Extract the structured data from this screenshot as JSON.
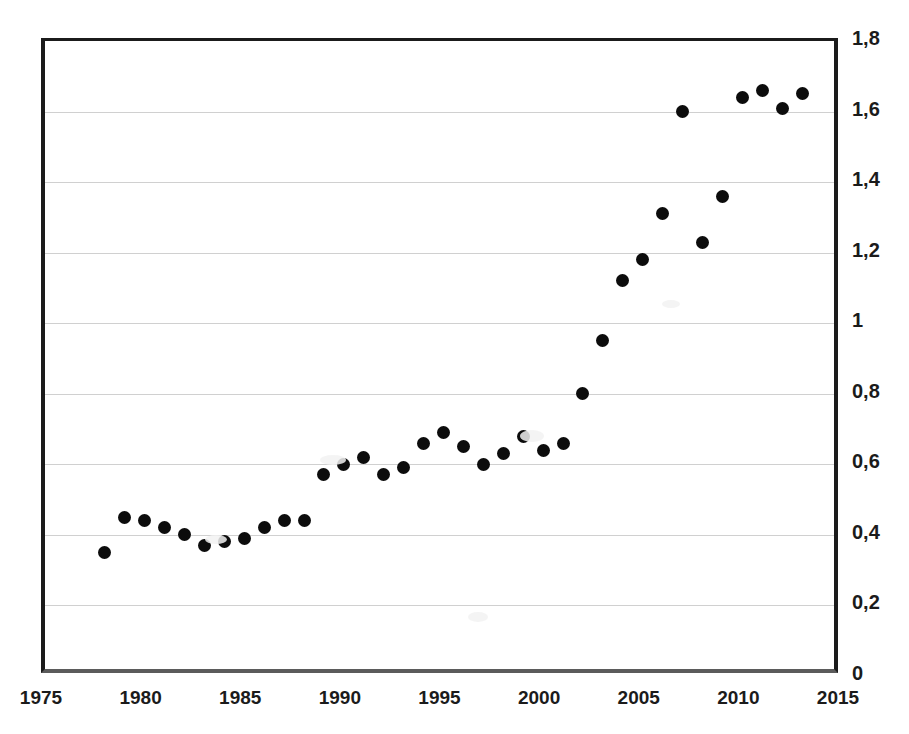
{
  "chart_data": {
    "type": "scatter",
    "title": "",
    "subtitle": "",
    "xlabel": "",
    "ylabel": "",
    "grid": true,
    "legend": null,
    "legend_position": "none",
    "xlim": [
      1975,
      2015
    ],
    "ylim": [
      0,
      1.8
    ],
    "xticks": [
      "1975",
      "1980",
      "1985",
      "1990",
      "1995",
      "2000",
      "2005",
      "2010",
      "2015"
    ],
    "xtick_values": [
      1975,
      1980,
      1985,
      1990,
      1995,
      2000,
      2005,
      2010,
      2015
    ],
    "yticks": [
      "0",
      "0,2",
      "0,4",
      "0,6",
      "0,8",
      "1",
      "1,2",
      "1,4",
      "1,6",
      "1,8"
    ],
    "ytick_values": [
      0,
      0.2,
      0.4,
      0.6,
      0.8,
      1,
      1.2,
      1.4,
      1.6,
      1.8
    ],
    "y_axis_side": "right",
    "decimal_separator": ",",
    "marker": "filled-circle",
    "marker_color": "#0c0c0c",
    "x": [
      1978,
      1979,
      1980,
      1981,
      1982,
      1983,
      1984,
      1985,
      1986,
      1987,
      1988,
      1989,
      1990,
      1991,
      1992,
      1993,
      1994,
      1995,
      1996,
      1997,
      1998,
      1999,
      2000,
      2001,
      2002,
      2003,
      2004,
      2005,
      2006,
      2007,
      2008,
      2009,
      2010,
      2011,
      2012,
      2013
    ],
    "values": [
      0.35,
      0.45,
      0.44,
      0.42,
      0.4,
      0.37,
      0.38,
      0.39,
      0.42,
      0.44,
      0.44,
      0.57,
      0.6,
      0.62,
      0.57,
      0.59,
      0.66,
      0.69,
      0.65,
      0.6,
      0.63,
      0.68,
      0.64,
      0.66,
      0.8,
      0.95,
      1.12,
      1.18,
      1.31,
      1.6,
      1.23,
      1.36,
      1.64,
      1.66,
      1.61,
      1.65
    ]
  }
}
